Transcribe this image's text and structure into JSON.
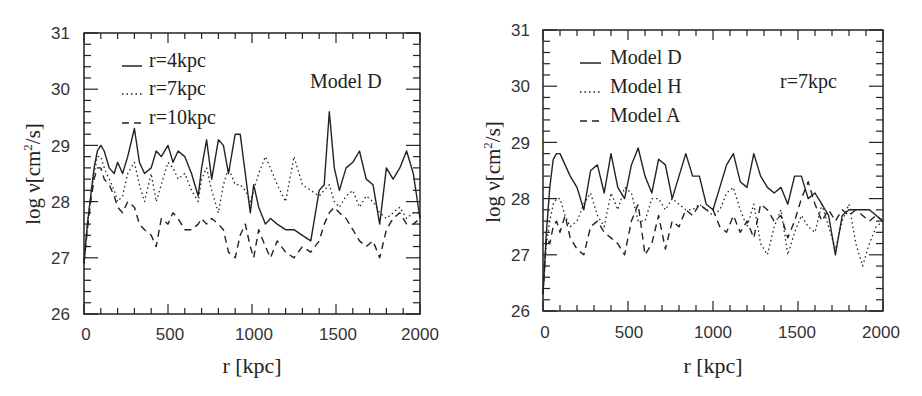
{
  "chart_data": [
    {
      "type": "line",
      "panel": "left",
      "title": "",
      "annotation": "Model D",
      "xlabel": "r [kpc]",
      "ylabel": "log ν[cm²/s]",
      "xlim": [
        0,
        2000
      ],
      "ylim": [
        26,
        31
      ],
      "xticks": [
        "0",
        "500",
        "1000",
        "1500",
        "2000"
      ],
      "yticks": [
        "26",
        "27",
        "28",
        "29",
        "30",
        "31"
      ],
      "grid": false,
      "legend_position": "upper-left",
      "x": [
        0,
        20,
        40,
        60,
        80,
        100,
        120,
        150,
        180,
        200,
        230,
        260,
        300,
        330,
        360,
        400,
        430,
        460,
        500,
        530,
        560,
        600,
        640,
        680,
        700,
        730,
        760,
        800,
        830,
        860,
        900,
        930,
        960,
        990,
        1010,
        1040,
        1080,
        1110,
        1150,
        1200,
        1250,
        1300,
        1350,
        1400,
        1430,
        1460,
        1490,
        1520,
        1560,
        1600,
        1640,
        1680,
        1720,
        1760,
        1800,
        1840,
        1880,
        1920,
        1960,
        2000
      ],
      "series": [
        {
          "name": "r=4kpc",
          "style": "solid",
          "values": [
            26.9,
            27.6,
            28.1,
            28.6,
            28.9,
            29.0,
            28.9,
            28.6,
            28.5,
            28.7,
            28.5,
            28.8,
            29.3,
            28.7,
            28.5,
            28.6,
            28.9,
            28.8,
            29.0,
            28.7,
            28.9,
            28.8,
            28.5,
            28.1,
            28.6,
            29.1,
            28.4,
            29.1,
            29.0,
            28.5,
            29.2,
            29.2,
            28.5,
            27.8,
            28.3,
            27.9,
            27.6,
            27.7,
            27.6,
            27.5,
            27.5,
            27.4,
            27.3,
            28.2,
            28.3,
            29.6,
            28.6,
            28.2,
            28.6,
            28.7,
            28.9,
            28.4,
            28.3,
            27.6,
            28.6,
            28.4,
            28.6,
            28.9,
            28.5,
            27.7
          ]
        },
        {
          "name": "r=7kpc",
          "style": "dotted",
          "values": [
            26.9,
            27.6,
            28.1,
            28.5,
            28.8,
            28.8,
            28.6,
            28.4,
            28.2,
            28.0,
            28.1,
            28.5,
            28.7,
            28.3,
            28.0,
            28.5,
            28.0,
            28.3,
            28.7,
            28.6,
            28.4,
            28.5,
            28.2,
            28.0,
            28.4,
            28.6,
            28.2,
            27.8,
            28.3,
            28.6,
            28.3,
            28.3,
            28.2,
            28.0,
            28.2,
            28.5,
            28.8,
            28.6,
            28.3,
            28.0,
            28.8,
            28.3,
            28.2,
            28.1,
            28.2,
            28.3,
            28.0,
            27.9,
            28.1,
            28.2,
            27.9,
            28.1,
            28.0,
            27.8,
            27.7,
            27.8,
            27.9,
            27.7,
            27.8,
            27.8
          ]
        },
        {
          "name": "r=10kpc",
          "style": "dashed",
          "values": [
            26.9,
            27.5,
            28.0,
            28.4,
            28.6,
            28.6,
            28.4,
            28.3,
            28.1,
            27.9,
            27.8,
            28.0,
            27.9,
            27.6,
            27.5,
            27.4,
            27.2,
            27.7,
            27.6,
            27.8,
            27.7,
            27.5,
            27.5,
            27.6,
            27.7,
            27.6,
            27.7,
            27.6,
            27.5,
            27.1,
            27.0,
            27.4,
            27.6,
            27.2,
            27.0,
            27.5,
            27.2,
            27.0,
            27.3,
            27.1,
            27.0,
            27.2,
            27.1,
            27.3,
            27.6,
            27.8,
            27.9,
            27.8,
            27.7,
            27.5,
            27.3,
            27.2,
            27.3,
            27.0,
            27.5,
            27.7,
            27.8,
            27.6,
            27.6,
            27.7
          ]
        }
      ]
    },
    {
      "type": "line",
      "panel": "right",
      "title": "",
      "annotation": "r=7kpc",
      "xlabel": "r [kpc]",
      "ylabel": "log ν[cm²/s]",
      "xlim": [
        0,
        2000
      ],
      "ylim": [
        26,
        31
      ],
      "xticks": [
        "0",
        "500",
        "1000",
        "1500",
        "2000"
      ],
      "yticks": [
        "26",
        "27",
        "28",
        "29",
        "30",
        "31"
      ],
      "grid": false,
      "legend_position": "upper-left",
      "x": [
        0,
        20,
        40,
        60,
        80,
        100,
        130,
        160,
        200,
        240,
        280,
        320,
        360,
        400,
        440,
        480,
        520,
        560,
        600,
        640,
        680,
        720,
        760,
        800,
        840,
        880,
        920,
        960,
        1000,
        1040,
        1080,
        1120,
        1160,
        1200,
        1240,
        1280,
        1320,
        1360,
        1400,
        1440,
        1480,
        1520,
        1560,
        1600,
        1640,
        1680,
        1720,
        1760,
        1800,
        1840,
        1880,
        1920,
        1960,
        2000
      ],
      "series": [
        {
          "name": "Model D",
          "style": "solid",
          "values": [
            26.3,
            27.4,
            28.2,
            28.7,
            28.8,
            28.8,
            28.6,
            28.4,
            28.2,
            27.8,
            28.5,
            28.6,
            28.1,
            28.8,
            28.2,
            28.0,
            28.6,
            28.9,
            28.4,
            28.1,
            28.7,
            28.6,
            28.0,
            28.4,
            28.8,
            28.4,
            28.4,
            27.9,
            27.8,
            28.2,
            28.6,
            28.8,
            28.3,
            28.2,
            28.8,
            28.4,
            28.2,
            28.1,
            28.2,
            27.9,
            28.4,
            28.4,
            28.0,
            28.1,
            27.9,
            27.7,
            27.0,
            27.7,
            27.8,
            27.8,
            27.8,
            27.8,
            27.7,
            27.6
          ]
        },
        {
          "name": "Model H",
          "style": "dotted",
          "values": [
            26.3,
            27.2,
            27.6,
            27.9,
            28.0,
            28.0,
            27.7,
            27.5,
            27.6,
            27.9,
            28.1,
            27.7,
            27.5,
            28.1,
            27.8,
            28.2,
            28.1,
            27.6,
            27.6,
            28.0,
            28.0,
            27.8,
            28.0,
            27.9,
            27.8,
            27.8,
            27.9,
            27.8,
            27.7,
            27.8,
            28.1,
            28.2,
            27.8,
            27.5,
            27.9,
            27.2,
            27.0,
            27.5,
            27.8,
            27.0,
            27.4,
            27.7,
            27.5,
            27.4,
            27.9,
            27.5,
            27.1,
            27.6,
            27.9,
            27.2,
            26.8,
            27.2,
            27.5,
            27.6
          ]
        },
        {
          "name": "Model A",
          "style": "dashed",
          "values": [
            26.3,
            27.3,
            27.2,
            27.5,
            27.6,
            27.4,
            27.7,
            27.3,
            27.1,
            27.0,
            27.5,
            27.6,
            27.4,
            27.3,
            27.2,
            27.0,
            27.6,
            27.9,
            27.0,
            27.2,
            27.7,
            27.1,
            27.6,
            27.5,
            27.8,
            27.7,
            27.9,
            27.8,
            27.8,
            27.5,
            27.4,
            27.7,
            27.4,
            27.6,
            27.3,
            27.9,
            27.8,
            27.6,
            27.7,
            27.3,
            27.6,
            28.0,
            28.3,
            27.9,
            27.6,
            27.8,
            27.6,
            27.8,
            27.7,
            27.8,
            27.7,
            27.6,
            27.7,
            27.6
          ]
        }
      ]
    }
  ],
  "panels": {
    "left": {
      "legend": [
        "r=4kpc",
        "r=7kpc",
        "r=10kpc"
      ],
      "annotation": "Model D",
      "xlabel": "r [kpc]",
      "ylabel_main": "log ν[cm",
      "ylabel_sup": "2",
      "ylabel_tail": "/s]",
      "xticks": [
        "0",
        "500",
        "1000",
        "1500",
        "2000"
      ],
      "yticks": [
        "26",
        "27",
        "28",
        "29",
        "30",
        "31"
      ]
    },
    "right": {
      "legend": [
        "Model D",
        "Model H",
        "Model A"
      ],
      "annotation": "r=7kpc",
      "xlabel": "r [kpc]",
      "ylabel_main": "log ν[cm",
      "ylabel_sup": "2",
      "ylabel_tail": "/s]",
      "xticks": [
        "0",
        "500",
        "1000",
        "1500",
        "2000"
      ],
      "yticks": [
        "26",
        "27",
        "28",
        "29",
        "30",
        "31"
      ]
    }
  }
}
